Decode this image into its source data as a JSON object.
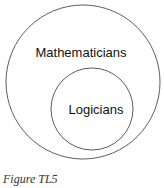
{
  "diagram": {
    "type": "euler",
    "sets": [
      {
        "label": "Mathematicians",
        "contains": [
          "Logicians"
        ]
      },
      {
        "label": "Logicians"
      }
    ]
  },
  "caption": "Figure TL5"
}
